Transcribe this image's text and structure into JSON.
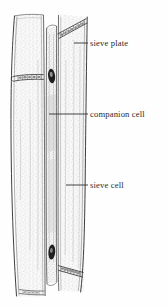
{
  "figure": {
    "kind": "botanical-line-drawing",
    "background_color": "#fefefe",
    "ink_color": "#3a3a3a",
    "stipple_color": "#b9b9b9",
    "nucleus_color": "#1c1c1c",
    "label_color": "#2b2b2b"
  },
  "labels": [
    {
      "id": "sieve-plate",
      "text": "sieve plate",
      "leader": {
        "x1": 74,
        "y1": 43,
        "x2": 88,
        "y2": 43
      }
    },
    {
      "id": "companion-cell",
      "text": "companion cell",
      "leader": {
        "x1": 49,
        "y1": 114,
        "x2": 88,
        "y2": 114
      }
    },
    {
      "id": "sieve-cell",
      "text": "sieve cell",
      "leader": {
        "x1": 66,
        "y1": 185,
        "x2": 88,
        "y2": 185
      }
    }
  ],
  "structures": {
    "left_sieve_cell": "left sieve cell",
    "right_sieve_cell": "right sieve cell",
    "companion_cell": "companion cell strip",
    "sieve_plates": [
      "top-right diagonal sieve plate",
      "left horizontal sieve plate",
      "bottom-right diagonal sieve plate",
      "bottom-left sieve plate"
    ],
    "nuclei": [
      "upper companion cell nucleus",
      "lower companion cell nucleus"
    ]
  }
}
